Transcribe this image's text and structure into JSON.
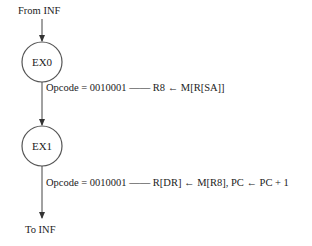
{
  "diagram": {
    "entry_label": "From INF",
    "exit_label": "To INF",
    "states": [
      {
        "name": "EX0",
        "condition": "Opcode = 0010001",
        "action": "R8 ← M[R[SA]]"
      },
      {
        "name": "EX1",
        "condition": "Opcode = 0010001",
        "action": "R[DR] ← M[R8], PC ← PC + 1"
      }
    ],
    "dash": "——"
  }
}
